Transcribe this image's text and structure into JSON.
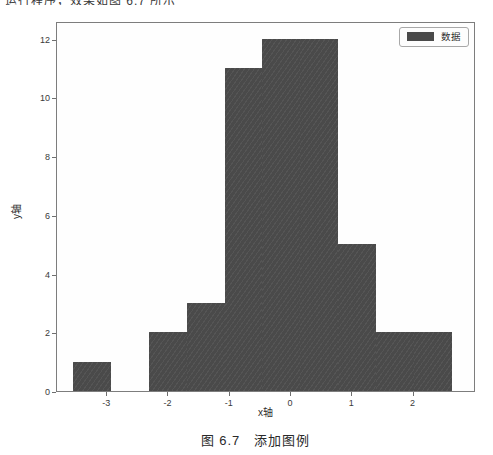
{
  "page": {
    "top_text_fragment": "运行程序，效果如图 6.7 所示",
    "caption": "图 6.7　添加图例"
  },
  "chart_data": {
    "type": "bar",
    "subtype": "histogram",
    "title": "",
    "xlabel": "x轴",
    "ylabel": "y轴",
    "legend": {
      "label": "数据",
      "position": "upper-right"
    },
    "bar_color": "#4a4a4a",
    "bin_edges": [
      -3.54,
      -2.92,
      -2.3,
      -1.68,
      -1.06,
      -0.45,
      0.17,
      0.79,
      1.41,
      2.03,
      2.65
    ],
    "values": [
      1,
      0,
      2,
      3,
      11,
      12,
      12,
      5,
      2,
      2
    ],
    "xticks": [
      -3,
      -2,
      -1,
      0,
      1,
      2
    ],
    "yticks": [
      0,
      2,
      4,
      6,
      8,
      10,
      12
    ],
    "xlim": [
      -3.82,
      3.02
    ],
    "ylim": [
      0,
      12.6
    ],
    "grid": false
  }
}
